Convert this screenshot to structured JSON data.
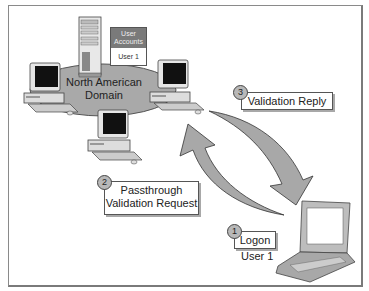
{
  "diagram": {
    "domain_label_line1": "North American",
    "domain_label_line2": "Domain",
    "user_accounts": {
      "header_line1": "User",
      "header_line2": "Accounts",
      "entry": "User 1"
    },
    "steps": [
      {
        "number": "1",
        "label": "Logon",
        "sublabel": "User 1"
      },
      {
        "number": "2",
        "label_line1": "Passthrough",
        "label_line2": "Validation Request"
      },
      {
        "number": "3",
        "label": "Validation Reply"
      }
    ],
    "icons": [
      "server-tower",
      "desktop-computer",
      "desktop-computer",
      "desktop-computer",
      "laptop",
      "curved-arrow-request",
      "curved-arrow-reply"
    ],
    "colors": {
      "domain_ellipse": "#a9a9a9",
      "arrow_fill": "#a8a8a8",
      "accounts_header": "#7a7a7a",
      "screen": "#111111"
    }
  }
}
